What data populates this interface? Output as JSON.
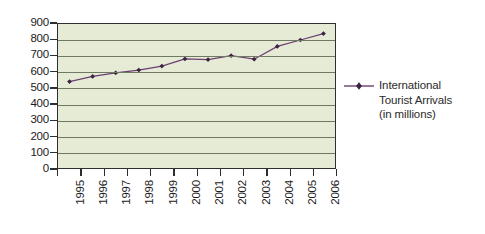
{
  "chart_data": {
    "type": "line",
    "title": "",
    "xlabel": "",
    "ylabel": "",
    "categories": [
      "1995",
      "1996",
      "1997",
      "1998",
      "1999",
      "2000",
      "2001",
      "2002",
      "2003",
      "2004",
      "2005",
      "2006"
    ],
    "series": [
      {
        "name": "International Tourist Arrivals (in millions)",
        "color": "#6b3f72",
        "marker": "diamond",
        "values": [
          540,
          572,
          595,
          612,
          637,
          682,
          678,
          702,
          680,
          760,
          800,
          840
        ]
      }
    ],
    "ylim": [
      0,
      900
    ],
    "y_ticks": [
      0,
      100,
      200,
      300,
      400,
      500,
      600,
      700,
      800,
      900
    ],
    "y_tick_labels": [
      "0",
      "100",
      "200",
      "300",
      "400",
      "500",
      "600",
      "700",
      "800",
      "900"
    ],
    "grid": true,
    "grid_axis": "y",
    "legend_position": "right",
    "plot_background": "#e6ebd6",
    "grid_color": "#6f7a63",
    "axis_color": "#2e2e2e"
  },
  "legend": {
    "entries": [
      {
        "line1": "International",
        "line2": "Tourist Arrivals",
        "line3": "(in millions)",
        "color": "#6b3f72"
      }
    ]
  }
}
